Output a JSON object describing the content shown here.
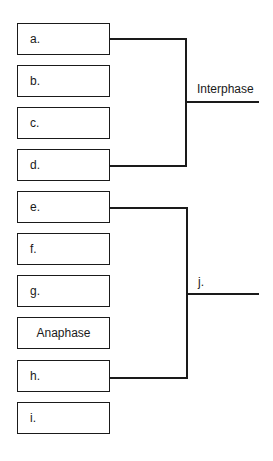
{
  "boxes": [
    {
      "label": "a."
    },
    {
      "label": "b."
    },
    {
      "label": "c."
    },
    {
      "label": "d."
    },
    {
      "label": "e."
    },
    {
      "label": "f."
    },
    {
      "label": "g."
    },
    {
      "label": "Anaphase"
    },
    {
      "label": "h."
    },
    {
      "label": "i."
    }
  ],
  "brackets": [
    {
      "label": "Interphase",
      "from": "a.",
      "to": "d."
    },
    {
      "label": "j.",
      "from": "e.",
      "to": "h."
    }
  ]
}
